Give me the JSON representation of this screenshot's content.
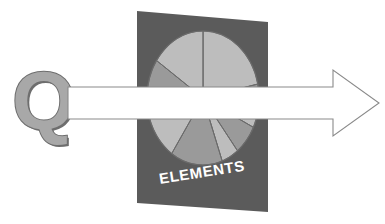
{
  "canvas": {
    "width": 385,
    "height": 224,
    "background": "#ffffff"
  },
  "illustration": {
    "name": "quality-through-elements-diagram",
    "description": "A bold letter Q at left, a large white outlined right-pointing arrow passing horizontally through a dark gray slanted panel that contains a segmented pie chart and the word ELEMENTS"
  },
  "letter": {
    "glyph": "Q",
    "fill": "#a8a8a8",
    "outline": "#6e6e6e",
    "x": 12,
    "y": 66,
    "font_size": 78
  },
  "arrow": {
    "label": "right-arrow",
    "fill": "#ffffff",
    "stroke": "#8a8a8a",
    "stroke_width": 1.1,
    "shaft_left": 68,
    "shaft_top": 87,
    "shaft_bottom": 119,
    "head_top": 70,
    "head_bottom": 136,
    "head_base_x": 333,
    "tip_x": 379,
    "tip_y": 103
  },
  "panel": {
    "label": "ELEMENTS",
    "fill": "#5b5b5b",
    "text_color": "#ffffff",
    "text_x": 160,
    "text_y": 183,
    "text_rotation": -9,
    "font_size": 14,
    "corners": {
      "top_left": [
        137,
        11
      ],
      "top_right": [
        268,
        22
      ],
      "bottom_right": [
        268,
        212
      ],
      "bottom_left": [
        137,
        203
      ]
    }
  },
  "chart_data": {
    "type": "pie",
    "title": "ELEMENTS",
    "center_x": 203,
    "center_y": 98,
    "radius_x": 56,
    "radius_y": 67,
    "grid": false,
    "legend": "none",
    "colors": {
      "light": "#bdbdbd",
      "mid": "#9a9a9a",
      "edge": "#6a6a6a"
    },
    "labels": [
      "Element 1",
      "Element 2",
      "Element 3",
      "Element 4",
      "Element 5",
      "Element 6",
      "Element 7",
      "Element 8",
      "Element 9"
    ],
    "values": [
      25,
      7,
      10,
      12,
      6,
      15,
      9,
      8,
      8
    ],
    "slice_start_angles_deg": [
      -90,
      -12,
      8,
      26,
      52,
      70,
      124,
      180,
      214
    ],
    "slice_end_angles_deg": [
      -12,
      8,
      26,
      52,
      70,
      124,
      180,
      214,
      270
    ],
    "slice_shades": [
      "light",
      "mid",
      "light",
      "mid",
      "light",
      "mid",
      "light",
      "mid",
      "light"
    ]
  },
  "accessibility": {
    "alt": "Letter Q with an arrow passing through a panel labelled ELEMENTS containing a pie chart"
  }
}
